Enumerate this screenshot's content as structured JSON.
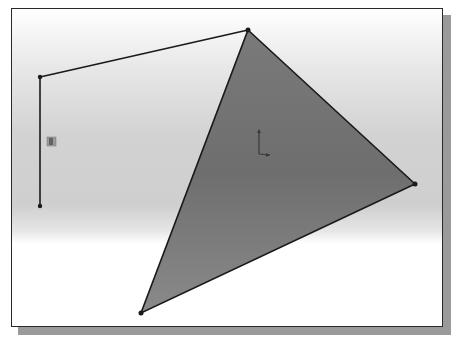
{
  "viewport": {
    "background_top": "#ffffff",
    "background_mid": "#d0d0d0",
    "background_bottom": "#ffffff",
    "border_color": "#2a2a2a",
    "shadow_color": "#9a9a9a"
  },
  "sketch": {
    "polyline_points": [
      [
        40,
        77
      ],
      [
        248,
        30
      ]
    ],
    "vertical_line": [
      [
        40,
        77
      ],
      [
        40,
        206
      ]
    ],
    "triangle_vertices": [
      [
        248,
        30
      ],
      [
        415,
        184
      ],
      [
        141,
        313
      ]
    ],
    "triangle_fill": "#8c8c8c",
    "line_color": "#1a1a1a",
    "endpoint_color": "#1a1a1a"
  },
  "icons": {
    "relation_marker": "vertical-relation-icon",
    "origin": "origin-axes-icon"
  }
}
